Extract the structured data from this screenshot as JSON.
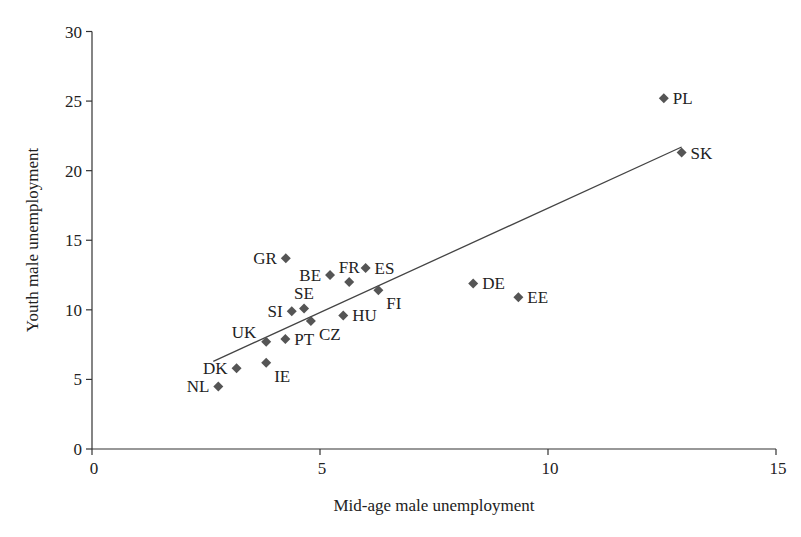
{
  "chart_data": {
    "type": "scatter",
    "title": "",
    "xlabel": "Mid-age male unemployment",
    "ylabel": "Youth male unemployment",
    "xlim": [
      0,
      15
    ],
    "ylim": [
      0,
      30
    ],
    "x_ticks": [
      0,
      5,
      10,
      15
    ],
    "y_ticks": [
      0,
      5,
      10,
      15,
      20,
      25,
      30
    ],
    "grid": false,
    "legend": null,
    "marker_color": "#555555",
    "points": [
      {
        "label": "NL",
        "x": 2.77,
        "y": 4.5,
        "label_pos": "left"
      },
      {
        "label": "DK",
        "x": 3.17,
        "y": 5.8,
        "label_pos": "left"
      },
      {
        "label": "IE",
        "x": 3.82,
        "y": 6.2,
        "label_pos": "below-right"
      },
      {
        "label": "UK",
        "x": 3.82,
        "y": 7.7,
        "label_pos": "above-left"
      },
      {
        "label": "PT",
        "x": 4.24,
        "y": 7.9,
        "label_pos": "right"
      },
      {
        "label": "GR",
        "x": 4.25,
        "y": 13.7,
        "label_pos": "left"
      },
      {
        "label": "SI",
        "x": 4.38,
        "y": 9.9,
        "label_pos": "left"
      },
      {
        "label": "SE",
        "x": 4.65,
        "y": 10.1,
        "label_pos": "above"
      },
      {
        "label": "CZ",
        "x": 4.8,
        "y": 9.2,
        "label_pos": "below-right"
      },
      {
        "label": "BE",
        "x": 5.22,
        "y": 12.5,
        "label_pos": "left"
      },
      {
        "label": "HU",
        "x": 5.51,
        "y": 9.6,
        "label_pos": "right"
      },
      {
        "label": "FR",
        "x": 5.64,
        "y": 12.0,
        "label_pos": "above"
      },
      {
        "label": "ES",
        "x": 6.0,
        "y": 13.0,
        "label_pos": "right"
      },
      {
        "label": "FI",
        "x": 6.28,
        "y": 11.4,
        "label_pos": "below-right"
      },
      {
        "label": "DE",
        "x": 8.36,
        "y": 11.9,
        "label_pos": "right"
      },
      {
        "label": "EE",
        "x": 9.35,
        "y": 10.9,
        "label_pos": "right"
      },
      {
        "label": "SK",
        "x": 12.93,
        "y": 21.3,
        "label_pos": "right"
      },
      {
        "label": "PL",
        "x": 12.54,
        "y": 25.2,
        "label_pos": "right"
      }
    ],
    "trendline": {
      "x0": 2.66,
      "y0": 6.3,
      "x1": 12.93,
      "y1": 21.7
    }
  }
}
